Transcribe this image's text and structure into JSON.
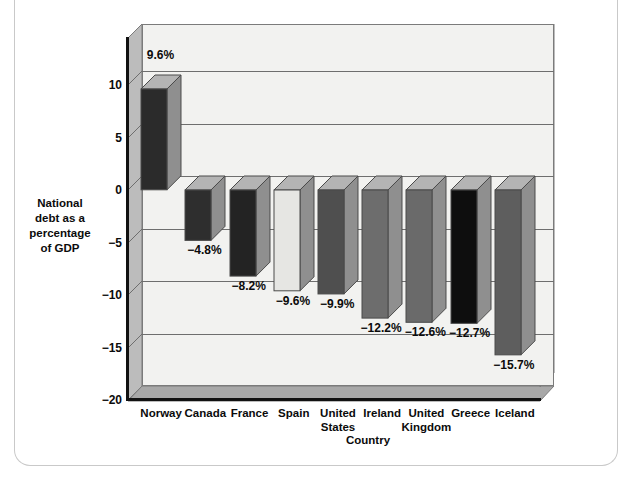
{
  "chart_data": {
    "type": "bar",
    "title": "",
    "subtitle": "",
    "xlabel": "Country",
    "ylabel": "National debt as a percentage of  GDP",
    "ylabel_lines": [
      "National",
      "debt as a",
      "percentage",
      "of  GDP"
    ],
    "categories": [
      "Norway",
      "Canada",
      "France",
      "Spain",
      "United States",
      "Ireland",
      "United Kingdom",
      "Greece",
      "Iceland"
    ],
    "category_lines": [
      [
        "Norway"
      ],
      [
        "Canada"
      ],
      [
        "France"
      ],
      [
        "Spain"
      ],
      [
        "United",
        "States"
      ],
      [
        "Ireland"
      ],
      [
        "United",
        "Kingdom"
      ],
      [
        "Greece"
      ],
      [
        "Iceland"
      ]
    ],
    "values": [
      9.6,
      -4.8,
      -8.2,
      -9.6,
      -9.9,
      -12.2,
      -12.6,
      -12.7,
      -15.7
    ],
    "data_labels": [
      "9.6%",
      "−4.8%",
      "−8.2%",
      "−9.6%",
      "−9.9%",
      "−12.2%",
      "−12.6%",
      "−12.7%",
      "−15.7%"
    ],
    "bar_colors": [
      "#2b2b2b",
      "#2e2e2e",
      "#232323",
      "#e6e6e3",
      "#4f4f4f",
      "#6d6d6d",
      "#6a6a6a",
      "#0e0e0e",
      "#5e5e5e"
    ],
    "ylim": [
      -20,
      13.5
    ],
    "yticks": [
      10,
      5,
      0,
      -5,
      -10,
      -15,
      -20
    ],
    "ytick_labels": [
      "10",
      "5",
      "0",
      "−5",
      "−10",
      "−15",
      "−20"
    ],
    "grid": true,
    "legend": "none",
    "style": "3d-column",
    "units": "percent"
  },
  "palette": {
    "plot_background": "#f2f2f0",
    "wall_shadow": "#bcbcbc",
    "floor_shadow": "#a8a8a8",
    "grid_color": "#6e6e6e",
    "frame_color": "#7b7b7b",
    "axis_color": "#111111",
    "text_color": "#0b0b0b",
    "page_background": "#ffffff",
    "card_border": "#c9c9c9"
  }
}
